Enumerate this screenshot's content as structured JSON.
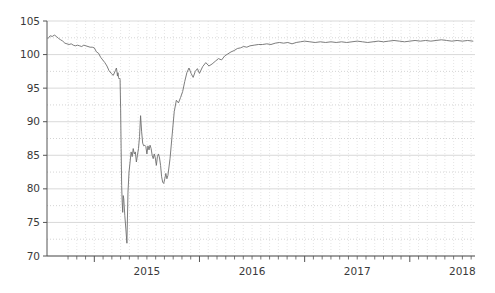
{
  "chart_data": {
    "type": "line",
    "title": "",
    "subtitle": "",
    "xlabel": "",
    "ylabel": "",
    "legend": [],
    "legend_position": "none",
    "grid": true,
    "grid_major_style": "solid",
    "grid_minor_style": "dotted",
    "line_color": "#6e6e6e",
    "line_width": 0.9,
    "axis_color": "#555555",
    "background": "#ffffff",
    "xlim": [
      2014.55,
      2018.62
    ],
    "ylim": [
      70,
      105
    ],
    "ytick_values": [
      70,
      75,
      80,
      85,
      90,
      95,
      100,
      105
    ],
    "ytick_labels": [
      "70",
      "75",
      "80",
      "85",
      "90",
      "95",
      "100",
      "105"
    ],
    "yminor_step": 2.5,
    "xtick_values": [
      2015,
      2016,
      2017,
      2018
    ],
    "xtick_labels": [
      "2015",
      "2016",
      "2017",
      "2018"
    ],
    "xminor_step": 0.08333,
    "series": [
      {
        "name": "series-1",
        "x": [
          2014.56,
          2014.58,
          2014.6,
          2014.62,
          2014.64,
          2014.66,
          2014.68,
          2014.7,
          2014.72,
          2014.74,
          2014.76,
          2014.78,
          2014.8,
          2014.82,
          2014.84,
          2014.86,
          2014.88,
          2014.9,
          2014.92,
          2014.94,
          2014.96,
          2014.98,
          2015.0,
          2015.02,
          2015.04,
          2015.06,
          2015.08,
          2015.1,
          2015.12,
          2015.14,
          2015.16,
          2015.18,
          2015.2,
          2015.21,
          2015.215,
          2015.22,
          2015.225,
          2015.23,
          2015.235,
          2015.24,
          2015.245,
          2015.25,
          2015.255,
          2015.26,
          2015.265,
          2015.27,
          2015.275,
          2015.28,
          2015.29,
          2015.3,
          2015.31,
          2015.32,
          2015.33,
          2015.34,
          2015.35,
          2015.36,
          2015.37,
          2015.38,
          2015.39,
          2015.4,
          2015.41,
          2015.42,
          2015.43,
          2015.44,
          2015.45,
          2015.46,
          2015.47,
          2015.48,
          2015.49,
          2015.5,
          2015.51,
          2015.52,
          2015.53,
          2015.54,
          2015.55,
          2015.56,
          2015.57,
          2015.58,
          2015.59,
          2015.6,
          2015.61,
          2015.62,
          2015.63,
          2015.64,
          2015.65,
          2015.66,
          2015.67,
          2015.68,
          2015.69,
          2015.7,
          2015.72,
          2015.74,
          2015.76,
          2015.78,
          2015.8,
          2015.82,
          2015.84,
          2015.86,
          2015.88,
          2015.9,
          2015.92,
          2015.94,
          2015.96,
          2015.98,
          2016.0,
          2016.03,
          2016.06,
          2016.09,
          2016.12,
          2016.15,
          2016.18,
          2016.21,
          2016.24,
          2016.27,
          2016.3,
          2016.33,
          2016.36,
          2016.39,
          2016.42,
          2016.45,
          2016.48,
          2016.52,
          2016.56,
          2016.6,
          2016.64,
          2016.68,
          2016.72,
          2016.76,
          2016.8,
          2016.84,
          2016.88,
          2016.92,
          2016.96,
          2017.0,
          2017.05,
          2017.1,
          2017.15,
          2017.2,
          2017.25,
          2017.3,
          2017.35,
          2017.4,
          2017.45,
          2017.5,
          2017.55,
          2017.6,
          2017.65,
          2017.7,
          2017.75,
          2017.8,
          2017.85,
          2017.9,
          2017.95,
          2018.0,
          2018.05,
          2018.1,
          2018.15,
          2018.2,
          2018.25,
          2018.3,
          2018.35,
          2018.4,
          2018.45,
          2018.5,
          2018.55,
          2018.6
        ],
        "y": [
          102.4,
          102.8,
          102.7,
          102.9,
          102.7,
          102.4,
          102.2,
          102.0,
          101.7,
          101.6,
          101.5,
          101.6,
          101.4,
          101.3,
          101.4,
          101.3,
          101.2,
          101.4,
          101.3,
          101.2,
          101.1,
          101.1,
          101.0,
          100.4,
          100.2,
          99.6,
          99.2,
          98.8,
          98.3,
          97.6,
          97.2,
          96.9,
          97.6,
          98.0,
          97.5,
          96.8,
          97.3,
          96.6,
          96.4,
          96.5,
          96.3,
          92.0,
          86.0,
          80.5,
          78.0,
          76.5,
          79.0,
          78.5,
          76.0,
          74.0,
          71.9,
          79.5,
          82.5,
          84.0,
          85.5,
          84.8,
          86.0,
          85.2,
          85.5,
          84.0,
          85.0,
          86.0,
          87.8,
          90.9,
          88.5,
          86.8,
          86.4,
          86.5,
          86.3,
          85.2,
          86.4,
          85.8,
          86.5,
          86.0,
          85.0,
          84.5,
          85.2,
          84.6,
          83.5,
          84.8,
          85.2,
          84.6,
          83.5,
          81.8,
          81.0,
          80.8,
          81.5,
          82.3,
          81.5,
          82.0,
          84.5,
          88.0,
          91.5,
          93.2,
          92.8,
          93.6,
          94.5,
          96.0,
          97.3,
          98.0,
          97.2,
          96.6,
          97.5,
          97.9,
          97.2,
          98.2,
          98.8,
          98.3,
          98.6,
          99.0,
          99.4,
          99.2,
          99.8,
          100.1,
          100.4,
          100.6,
          100.9,
          101.0,
          101.2,
          101.1,
          101.3,
          101.4,
          101.5,
          101.5,
          101.6,
          101.5,
          101.7,
          101.8,
          101.7,
          101.8,
          101.6,
          101.8,
          101.9,
          102.0,
          101.9,
          101.8,
          101.9,
          101.8,
          101.9,
          101.8,
          101.9,
          101.8,
          101.9,
          102.0,
          101.9,
          101.8,
          101.9,
          102.0,
          101.9,
          102.0,
          102.1,
          102.0,
          101.9,
          102.0,
          102.1,
          102.0,
          102.1,
          102.0,
          102.1,
          102.2,
          102.1,
          102.0,
          102.1,
          102.0,
          102.1,
          102.0
        ]
      }
    ]
  },
  "plot_geometry": {
    "left": 47,
    "right": 475,
    "top": 21,
    "bottom": 256
  }
}
